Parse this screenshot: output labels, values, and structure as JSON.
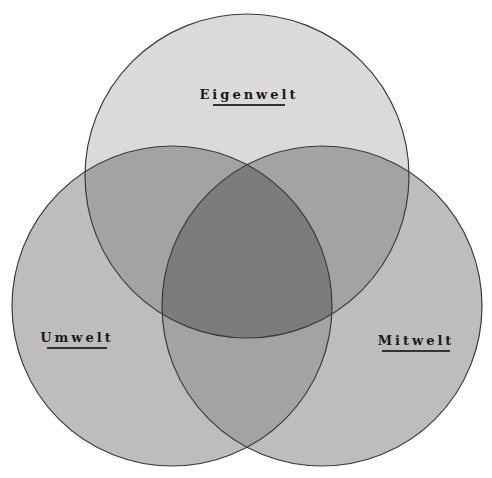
{
  "diagram": {
    "type": "venn",
    "sets": [
      {
        "id": "top",
        "label": "Eigenwelt",
        "cx": 247,
        "cy": 176,
        "r": 162
      },
      {
        "id": "left",
        "label": "Umwelt",
        "cx": 172,
        "cy": 306,
        "r": 160
      },
      {
        "id": "right",
        "label": "Mitwelt",
        "cx": 322,
        "cy": 306,
        "r": 160
      }
    ],
    "colors": {
      "top_only": "#dadada",
      "side_only": "#bdbdbd",
      "pair_overlap": "#a3a3a3",
      "triple_overlap": "#7c7c7c",
      "stroke": "#3a3a3a"
    }
  },
  "labels": {
    "eigenwelt": "Eigenwelt",
    "umwelt": "Umwelt",
    "mitwelt": "Mitwelt"
  }
}
